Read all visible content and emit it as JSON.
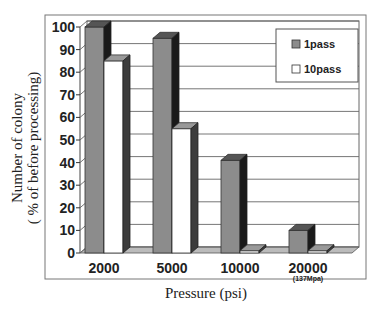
{
  "chart_data": {
    "type": "bar",
    "title": "",
    "xlabel": "Pressure (psi)",
    "ylabel_line1": "Number of colony",
    "ylabel_line2": "( % of before processing)",
    "categories": [
      "2000",
      "5000",
      "10000",
      "20000"
    ],
    "category_sublabels": [
      "",
      "",
      "",
      "(137Mpa)"
    ],
    "series": [
      {
        "name": "1pass",
        "color": "#8c8c8c",
        "values": [
          100,
          95,
          41,
          10
        ]
      },
      {
        "name": "10pass",
        "color": "#ffffff",
        "values": [
          85,
          55,
          1,
          1
        ]
      }
    ],
    "ylim": [
      0,
      100
    ],
    "yticks": [
      0,
      10,
      20,
      30,
      40,
      50,
      60,
      70,
      80,
      90,
      100
    ],
    "grid": true,
    "legend_position": "top-right",
    "style": "3d-bar"
  },
  "legend": {
    "items": [
      {
        "label": "1pass",
        "color": "#8c8c8c"
      },
      {
        "label": "10pass",
        "color": "#ffffff"
      }
    ]
  }
}
